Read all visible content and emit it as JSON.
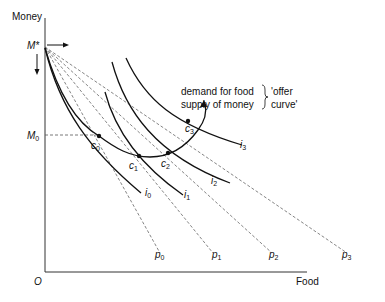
{
  "axes": {
    "y_label": "Money",
    "x_label": "Food",
    "origin_label": "O"
  },
  "points": {
    "m_star": "M*",
    "m_zero": "M",
    "m_zero_sub": "0"
  },
  "equilibria": [
    {
      "label": "c",
      "sub": "0"
    },
    {
      "label": "c",
      "sub": "1"
    },
    {
      "label": "c",
      "sub": "2"
    },
    {
      "label": "c",
      "sub": "3"
    }
  ],
  "indifference_curves": [
    {
      "label": "i",
      "sub": "0"
    },
    {
      "label": "i",
      "sub": "1"
    },
    {
      "label": "i",
      "sub": "2"
    },
    {
      "label": "i",
      "sub": "3"
    }
  ],
  "price_lines": [
    {
      "label": "p",
      "sub": "0"
    },
    {
      "label": "p",
      "sub": "1"
    },
    {
      "label": "p",
      "sub": "2"
    },
    {
      "label": "p",
      "sub": "3"
    }
  ],
  "annotation": {
    "line1": "demand for food",
    "line2": "supply of money",
    "bracket_line1": "'offer",
    "bracket_line2": "curve'"
  }
}
